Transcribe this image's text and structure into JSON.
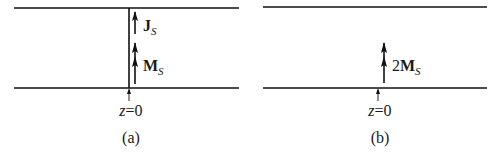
{
  "panels": [
    {
      "id": "a",
      "caption": "(a)",
      "position_label": {
        "var": "z",
        "eq": "=0"
      },
      "vectors": [
        {
          "symbol": "J",
          "subscript": "S",
          "prefix": "",
          "arrow_heads": 1
        },
        {
          "symbol": "M",
          "subscript": "S",
          "prefix": "",
          "arrow_heads": 2
        }
      ],
      "has_interface_line": true
    },
    {
      "id": "b",
      "caption": "(b)",
      "position_label": {
        "var": "z",
        "eq": "=0"
      },
      "vectors": [
        {
          "symbol": "M",
          "subscript": "S",
          "prefix": "2",
          "arrow_heads": 2
        }
      ],
      "has_interface_line": false
    }
  ],
  "colors": {
    "line": "#111111",
    "text": "#1a1a1a",
    "background": "#ffffff"
  }
}
